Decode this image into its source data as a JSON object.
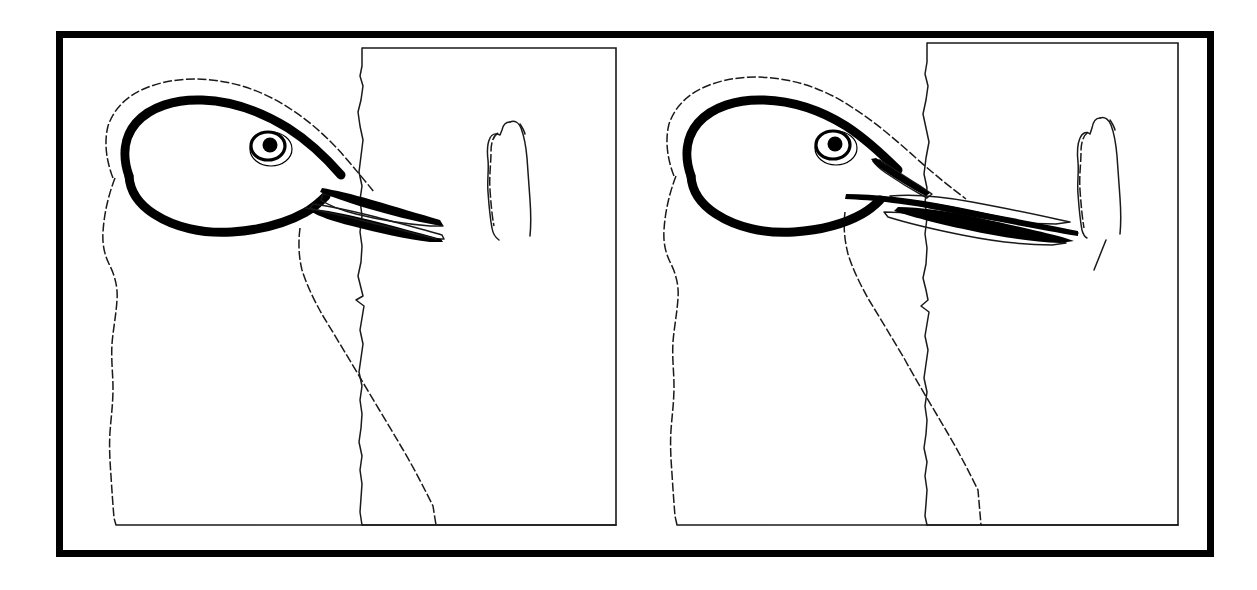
{
  "figure": {
    "type": "scientific-line-illustration",
    "background_color": "#ffffff",
    "ink_color": "#000000",
    "width": 1257,
    "height": 590,
    "caption": "",
    "label": "",
    "outer_frame": {
      "name": "figure-border",
      "x": 56,
      "y": 31,
      "width": 1158,
      "height": 526,
      "stroke_width": 7,
      "color": "#000000"
    },
    "panels": [
      {
        "id": "panel-left",
        "label": "",
        "index": 1,
        "substrate_rect": {
          "x": 362,
          "y": 48,
          "width": 254,
          "height": 477
        },
        "ground_line": {
          "x1": 116,
          "y1": 525,
          "x2": 616,
          "y2": 525
        },
        "eye": {
          "cx": 268,
          "cy": 146,
          "rx": 17,
          "ry": 14,
          "pupil_r": 7.5
        },
        "bill_tip_x": 443,
        "bill_contacts_substrate": false,
        "gape_state": "closed-narrow",
        "detached_shape": {
          "name": "tongue-hyoid-element",
          "x": 492,
          "y": 118,
          "width": 45,
          "height": 122
        }
      },
      {
        "id": "panel-right",
        "label": "",
        "index": 2,
        "substrate_rect": {
          "x": 927,
          "y": 43,
          "width": 251,
          "height": 482
        },
        "ground_line": {
          "x1": 677,
          "y1": 525,
          "x2": 1178,
          "y2": 525
        },
        "eye": {
          "cx": 833,
          "cy": 145,
          "rx": 17,
          "ry": 14,
          "pupil_r": 7.5
        },
        "bill_tip_x": 1078,
        "bill_contacts_substrate": true,
        "gape_state": "open-wide",
        "detached_shape": {
          "name": "tongue-hyoid-element",
          "x": 1078,
          "y": 116,
          "width": 44,
          "height": 120
        }
      }
    ],
    "elements": [
      {
        "name": "skull-cranium-outline",
        "style": "thick-black-stroke"
      },
      {
        "name": "head-feather-outline",
        "style": "thin-dashed-stroke"
      },
      {
        "name": "upper-mandible",
        "style": "thin-outline-with-thick-edge"
      },
      {
        "name": "lower-mandible",
        "style": "thin-outline-with-thick-edge"
      },
      {
        "name": "eye",
        "style": "ring-with-filled-pupil"
      },
      {
        "name": "neck-body-outline",
        "style": "thin-dashed-stroke"
      },
      {
        "name": "substrate-trunk-rectangle",
        "style": "thin-stroke"
      },
      {
        "name": "trunk-bark-edge",
        "style": "thin-wavy-stroke"
      }
    ]
  }
}
